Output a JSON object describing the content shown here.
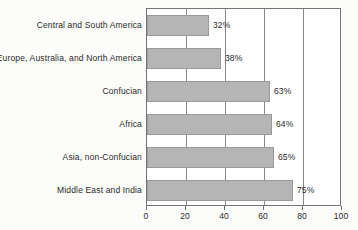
{
  "chart_data": {
    "type": "bar",
    "orientation": "horizontal",
    "title": "",
    "subtitle": "",
    "xlabel": "",
    "ylabel": "",
    "xlim": [
      0,
      100
    ],
    "xticks": [
      0,
      20,
      40,
      60,
      80,
      100
    ],
    "xtick_labels": [
      "0",
      "20",
      "40",
      "60",
      "80",
      "100"
    ],
    "grid": true,
    "grid_axis": "x",
    "legend": false,
    "legend_position": "none",
    "bar_color": "#b6b6b6",
    "bar_edge_color": "#9a9a9a",
    "axis_color": "#757575",
    "text_color": "#2a2a2a",
    "categories": [
      "Central and South America",
      "Europe, Australia, and North America",
      "Confucian",
      "Africa",
      "Asia, non-Confucian",
      "Middle East and India"
    ],
    "values": [
      32,
      38,
      63,
      64,
      65,
      75
    ],
    "data_labels": [
      "32%",
      "38%",
      "63%",
      "64%",
      "65%",
      "75%"
    ],
    "series": [
      {
        "name": "",
        "values": [
          32,
          38,
          63,
          64,
          65,
          75
        ]
      }
    ]
  }
}
